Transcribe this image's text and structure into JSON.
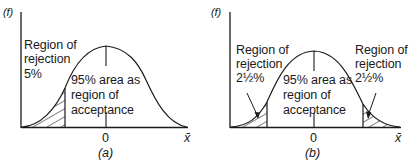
{
  "panels": [
    {
      "id": "a",
      "caption": "(a)",
      "y_axis_label": "(f)",
      "x_axis_label": "x̄",
      "center_tick": "0",
      "rejection_label": [
        "Region of",
        "rejection",
        "5%"
      ],
      "acceptance_label": [
        "95% area as",
        "region of",
        "acceptance"
      ]
    },
    {
      "id": "b",
      "caption": "(b)",
      "y_axis_label": "(f)",
      "x_axis_label": "x̄",
      "center_tick": "0",
      "left_rejection_label": [
        "Region of",
        "rejection",
        "2½%"
      ],
      "right_rejection_label": [
        "Region of",
        "rejection",
        "2½%"
      ],
      "acceptance_label": [
        "95% area as",
        "region of",
        "acceptance"
      ]
    }
  ],
  "colors": {
    "ink": "#1a1a1a",
    "background": "#ffffff"
  }
}
